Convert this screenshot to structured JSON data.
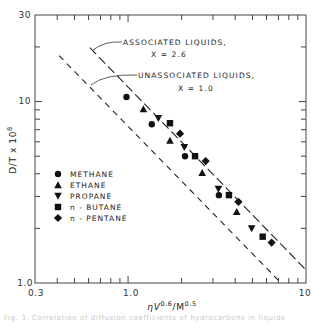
{
  "chart_data": {
    "type": "scatter",
    "title": "",
    "xlabel": "ηV^0.6 / M^0.5",
    "xlabel_main": "ηV",
    "xlabel_sup1": "0.6",
    "xlabel_mid": "/M",
    "xlabel_sup2": "0.5",
    "ylabel": "D/T x 10^8",
    "ylabel_main": "D/T x 10",
    "ylabel_sup": "8",
    "xscale": "log",
    "yscale": "log",
    "xlim": [
      0.3,
      10
    ],
    "ylim": [
      1.0,
      30
    ],
    "x_tick_labels": [
      {
        "value": 0.3,
        "label": "0.3"
      },
      {
        "value": 1.0,
        "label": "1.0"
      },
      {
        "value": 10,
        "label": "10"
      }
    ],
    "y_tick_labels": [
      {
        "value": 1.0,
        "label": "1.0"
      },
      {
        "value": 10,
        "label": "10"
      },
      {
        "value": 30,
        "label": "30"
      }
    ],
    "grid": false,
    "legend_position": "center-left",
    "series": [
      {
        "name": "METHANE",
        "marker": "circle",
        "points": [
          [
            0.98,
            10.6
          ],
          [
            1.36,
            7.5
          ],
          [
            2.09,
            5.0
          ],
          [
            3.24,
            3.05
          ]
        ]
      },
      {
        "name": "ETHANE",
        "marker": "triangle-up",
        "points": [
          [
            1.22,
            9.1
          ],
          [
            1.72,
            6.1
          ],
          [
            2.61,
            4.05
          ],
          [
            4.08,
            2.47
          ]
        ]
      },
      {
        "name": "PROPANE",
        "marker": "triangle-down",
        "points": [
          [
            1.48,
            8.1
          ],
          [
            2.07,
            5.6
          ],
          [
            3.22,
            3.3
          ],
          [
            4.95,
            2.0
          ]
        ]
      },
      {
        "name": "n - BUTANE",
        "marker": "square",
        "points": [
          [
            1.72,
            7.6
          ],
          [
            2.38,
            5.0
          ],
          [
            3.69,
            3.05
          ],
          [
            5.71,
            1.8
          ]
        ]
      },
      {
        "name": "n - PENTANE",
        "marker": "diamond",
        "points": [
          [
            1.96,
            6.65
          ],
          [
            2.73,
            4.7
          ],
          [
            4.17,
            2.8
          ],
          [
            6.41,
            1.67
          ]
        ]
      }
    ],
    "lines": [
      {
        "name": "associated",
        "style": "long-dash",
        "from": [
          0.61,
          19.8
        ],
        "to": [
          10,
          1.18
        ],
        "label_line1": "ASSOCIATED LIQUIDS,",
        "label_line2": "X = 2.6"
      },
      {
        "name": "unassociated",
        "style": "short-dash",
        "from": [
          0.41,
          17.9
        ],
        "to": [
          7.03,
          1.03
        ],
        "label_line1": "UNASSOCIATED LIQUIDS,",
        "label_line2": "X = 1.0"
      }
    ]
  },
  "caption": "Fig. 3. Correlation of diffusion coefficients of hydrocarbons in liquids"
}
